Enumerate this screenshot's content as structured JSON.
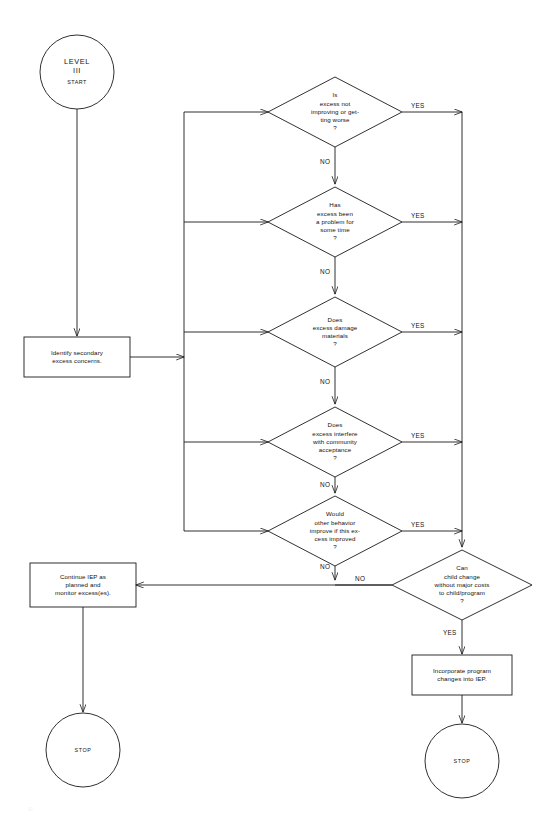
{
  "diagram": {
    "stroke_color": "#1a1a1a",
    "fill_color": "#ffffff"
  },
  "start": {
    "line1": "LEVEL",
    "line2": "III",
    "line3": "START"
  },
  "boxes": {
    "identify": [
      "Identify secondary",
      "excess concerns."
    ],
    "continue": [
      "Continue IEP as",
      "planned and",
      "monitor excess(es)."
    ],
    "incorporate": [
      "Incorporate program",
      "changes into IEP."
    ]
  },
  "decisions": [
    {
      "id": "d1",
      "lines": [
        "Is",
        "excess not",
        "improving or get-",
        "ting worse",
        "?"
      ],
      "yes": "YES",
      "no": "NO"
    },
    {
      "id": "d2",
      "lines": [
        "Has",
        "excess been",
        "a problem for",
        "some time",
        "?"
      ],
      "yes": "YES",
      "no": "NO"
    },
    {
      "id": "d3",
      "lines": [
        "Does",
        "excess damage",
        "materials",
        "?"
      ],
      "yes": "YES",
      "no": "NO"
    },
    {
      "id": "d4",
      "lines": [
        "Does",
        "excess interfere",
        "with community",
        "acceptance",
        "?"
      ],
      "yes": "YES",
      "no": "NO"
    },
    {
      "id": "d5",
      "lines": [
        "Would",
        "other behavior",
        "improve if this ex-",
        "cess improved",
        "?"
      ],
      "yes": "YES",
      "no": "NO"
    },
    {
      "id": "d6",
      "lines": [
        "Can",
        "child change",
        "without major costs",
        "to child/program",
        "?"
      ],
      "yes": "YES",
      "no": "NO"
    }
  ],
  "stops": {
    "left": "STOP",
    "right": "STOP"
  },
  "footer": {
    "note": "I0"
  }
}
